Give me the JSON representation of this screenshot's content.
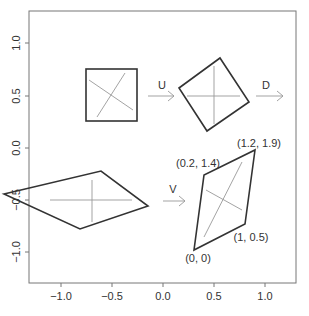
{
  "figure": {
    "type": "svd-geometry-diagram",
    "plot_box": {
      "left": 29,
      "top": 11,
      "right": 296,
      "bottom": 283
    },
    "colors": {
      "frame": "#777777",
      "shape": "#333333",
      "axes_inner": "#999999",
      "text": "#333333"
    }
  },
  "axes": {
    "x_ticks": [
      {
        "label": "−1.0",
        "px": 61
      },
      {
        "label": "−0.5",
        "px": 112
      },
      {
        "label": "0.0",
        "px": 163
      },
      {
        "label": "0.5",
        "px": 214
      },
      {
        "label": "1.0",
        "px": 265
      }
    ],
    "y_ticks": [
      {
        "label": "1.0",
        "py": 43
      },
      {
        "label": "0.5",
        "py": 96
      },
      {
        "label": "0.0",
        "py": 148
      },
      {
        "label": "−0.5",
        "py": 200
      },
      {
        "label": "−1.0",
        "py": 252
      }
    ]
  },
  "transforms": {
    "u_label": "U",
    "d_label": "D",
    "v_label": "V"
  },
  "annotations": {
    "origin": "(0, 0)",
    "p1": "(0.2, 1.4)",
    "p2": "(1.2, 1.9)",
    "p3": "(1, 0.5)"
  }
}
